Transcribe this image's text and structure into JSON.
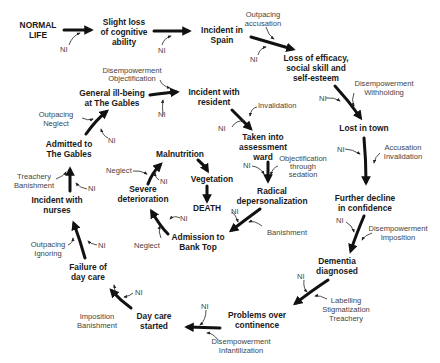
{
  "diagram": {
    "type": "flow-diagram",
    "colors": {
      "text": "#1a1a1a",
      "factor_text": "#444444",
      "arrow": "#111111",
      "background": "#ffffff"
    },
    "nodes": [
      {
        "id": "normal_life",
        "lines": [
          "NORMAL",
          "LIFE"
        ]
      },
      {
        "id": "slight_loss",
        "lines": [
          "Slight loss",
          "of cognitive",
          "ability"
        ]
      },
      {
        "id": "incident_spain",
        "lines": [
          "Incident in",
          "Spain"
        ]
      },
      {
        "id": "loss_efficacy",
        "lines": [
          "Loss of efficacy,",
          "social skill and",
          "self-esteem"
        ]
      },
      {
        "id": "lost_in_town",
        "lines": [
          "Lost in town"
        ]
      },
      {
        "id": "further_decline",
        "lines": [
          "Further decline",
          "in confidence"
        ]
      },
      {
        "id": "dementia_diagnosed",
        "lines": [
          "Dementia",
          "diagnosed"
        ]
      },
      {
        "id": "problems_continence",
        "lines": [
          "Problems over",
          "continence"
        ]
      },
      {
        "id": "day_care_started",
        "lines": [
          "Day care",
          "started"
        ]
      },
      {
        "id": "failure_day_care",
        "lines": [
          "Failure of",
          "day care"
        ]
      },
      {
        "id": "incident_nurses",
        "lines": [
          "Incident with",
          "nurses"
        ]
      },
      {
        "id": "admitted_gables",
        "lines": [
          "Admitted to",
          "The Gables"
        ]
      },
      {
        "id": "general_ill_being",
        "lines": [
          "General ill-being",
          "at The Gables"
        ]
      },
      {
        "id": "incident_resident",
        "lines": [
          "Incident with",
          "resident"
        ]
      },
      {
        "id": "assessment_ward",
        "lines": [
          "Taken into",
          "assessment",
          "ward"
        ]
      },
      {
        "id": "radical_depersonalization",
        "lines": [
          "Radical",
          "depersonalization"
        ]
      },
      {
        "id": "admission_bank_top",
        "lines": [
          "Admission to",
          "Bank Top"
        ]
      },
      {
        "id": "severe_deterioration",
        "lines": [
          "Severe",
          "deterioration"
        ]
      },
      {
        "id": "malnutrition",
        "lines": [
          "Malnutrition"
        ]
      },
      {
        "id": "vegetation",
        "lines": [
          "Vegetation"
        ]
      },
      {
        "id": "death",
        "lines": [
          "DEATH"
        ]
      }
    ],
    "factors": {
      "ni": "NI",
      "f1": [
        "Outpacing",
        "accusation"
      ],
      "f2": [
        "Disempowerment",
        "Withholding"
      ],
      "f3": [
        "Accusation",
        "Invalidation"
      ],
      "f4": [
        "Disempowerment",
        "Imposition"
      ],
      "f5": [
        "Labelling",
        "Stigmatization",
        "Treachery"
      ],
      "f6": [
        "Disempowerment",
        "Infantilization"
      ],
      "f7": [
        "Imposition",
        "Banishment"
      ],
      "f8": [
        "Outpacing",
        "Ignoring"
      ],
      "f9": [
        "Treachery",
        "Banishment"
      ],
      "f10": [
        "Outpacing",
        "Neglect"
      ],
      "f11": [
        "Disempowerment",
        "Objectification"
      ],
      "f12": [
        "Invalidation"
      ],
      "f13": [
        "Objectification",
        "through",
        "sedation"
      ],
      "f14": [
        "Banishment"
      ],
      "f15": [
        "Neglect"
      ],
      "f16": [
        "Neglect"
      ]
    }
  }
}
